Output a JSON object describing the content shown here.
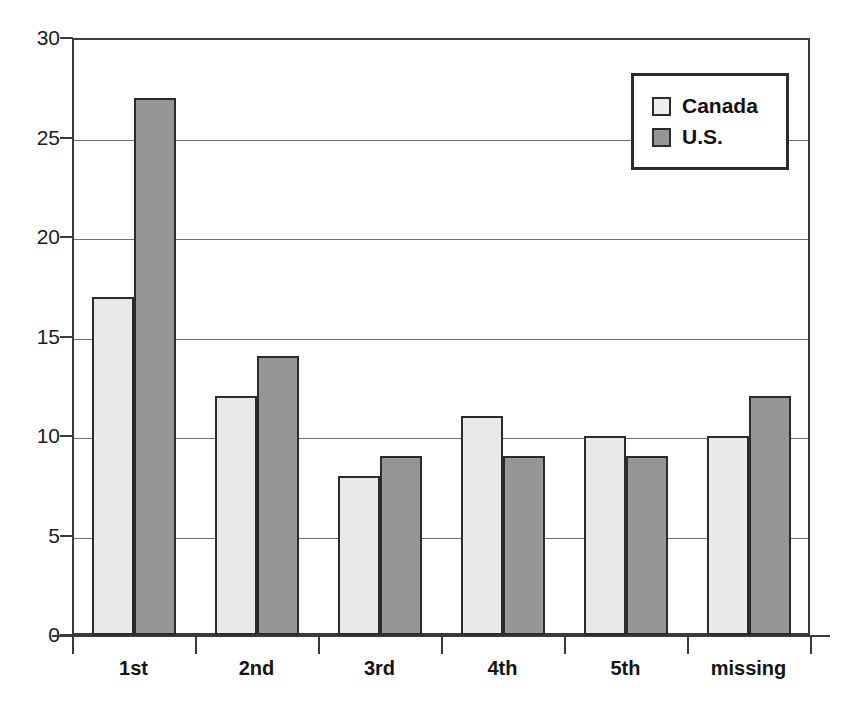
{
  "chart_data": {
    "type": "bar",
    "title": "",
    "subtitle": "",
    "xlabel": "",
    "ylabel": "",
    "categories": [
      "1st",
      "2nd",
      "3rd",
      "4th",
      "5th",
      "missing"
    ],
    "series": [
      {
        "name": "Canada",
        "values": [
          17,
          12,
          8,
          11,
          10,
          10
        ],
        "color": "#e9e9e9"
      },
      {
        "name": "U.S.",
        "values": [
          27,
          14,
          9,
          9,
          9,
          12
        ],
        "color": "#969696"
      }
    ],
    "ylim": [
      0,
      30
    ],
    "ytick_labels": [
      "0",
      "5",
      "10",
      "15",
      "20",
      "25",
      "30"
    ],
    "ytick_values": [
      0,
      5,
      10,
      15,
      20,
      25,
      30
    ],
    "grid": true,
    "grid_axis": "y",
    "legend": {
      "position": "top-right",
      "entries": [
        {
          "label": "Canada",
          "swatch": "light-gray-square",
          "color": "#ededed"
        },
        {
          "label": "U.S.",
          "swatch": "medium-gray-square",
          "color": "#969696"
        }
      ]
    },
    "axis_color": "#3a3a3a",
    "bar_outline_color": "#2b2b2b",
    "background": "#ffffff"
  }
}
